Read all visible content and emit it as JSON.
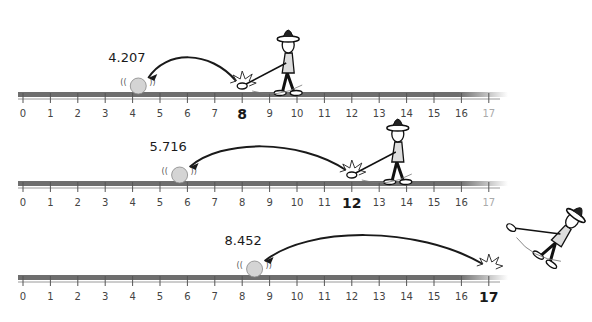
{
  "diagram": {
    "title": "",
    "axis": {
      "min": 0,
      "max": 17,
      "ticks": [
        0,
        1,
        2,
        3,
        4,
        5,
        6,
        7,
        8,
        9,
        10,
        11,
        12,
        13,
        14,
        15,
        16,
        17
      ]
    },
    "rows": [
      {
        "start": 8,
        "start_label": "8",
        "landing": 4.207,
        "landing_label": "4.207"
      },
      {
        "start": 12,
        "start_label": "12",
        "landing": 5.716,
        "landing_label": "5.716"
      },
      {
        "start": 17,
        "start_label": "17",
        "landing": 8.452,
        "landing_label": "8.452"
      }
    ],
    "colors": {
      "line": "#6e6e6e",
      "ink": "#1a1a1a",
      "ball": "#d4d4d4",
      "tick_label": "#444444"
    }
  }
}
